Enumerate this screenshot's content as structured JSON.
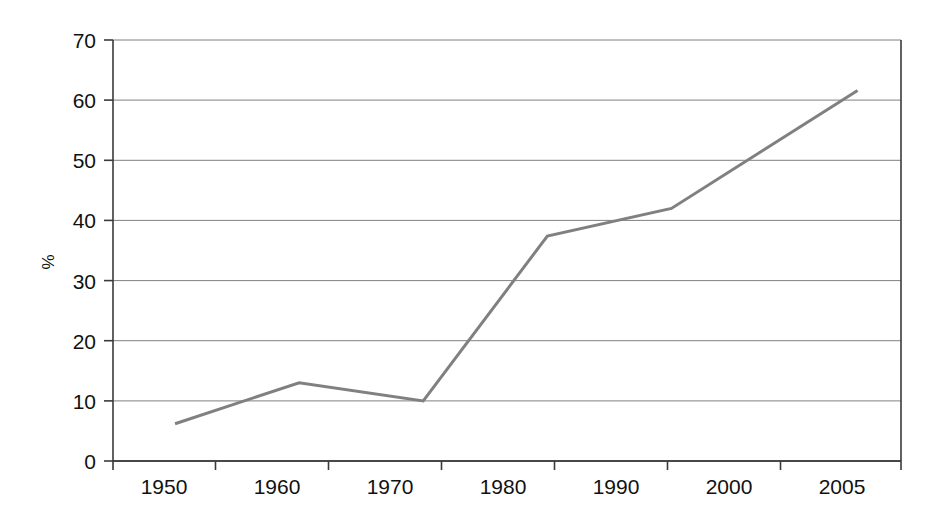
{
  "figure": {
    "background_color": "#ffffff",
    "width": 942,
    "height": 531
  },
  "plot_area": {
    "left": 113,
    "right": 901,
    "top": 40,
    "bottom": 461,
    "border_color": "#3a3a3a",
    "gridline_color": "#808080"
  },
  "axes": {
    "y_label": "%",
    "x_label": "",
    "y_ticks": [
      "0",
      "10",
      "20",
      "30",
      "40",
      "50",
      "60",
      "70"
    ],
    "x_ticks": [
      "1950",
      "1960",
      "1970",
      "1980",
      "1990",
      "2000",
      "2005"
    ]
  },
  "series_style": {
    "line_color": "#808080",
    "line_width": 3
  },
  "chart_data": {
    "type": "line",
    "title": "",
    "xlabel": "",
    "ylabel": "%",
    "categories": [
      "1950",
      "1960",
      "1970",
      "1980",
      "1990",
      "2000",
      "2005"
    ],
    "x": [
      1950,
      1960,
      1970,
      1980,
      1990,
      2000,
      2005
    ],
    "series": [
      {
        "name": "%",
        "values": [
          6.2,
          13.0,
          10.0,
          37.4,
          42.0,
          null,
          61.6
        ],
        "color": "#808080"
      }
    ],
    "points": [
      {
        "x": 1950,
        "y": 6.2
      },
      {
        "x": 1960,
        "y": 13.0
      },
      {
        "x": 1970,
        "y": 10.0
      },
      {
        "x": 1980,
        "y": 37.4
      },
      {
        "x": 1990,
        "y": 42.0
      },
      {
        "x": 2005,
        "y": 61.6
      }
    ],
    "xlim": [
      1945,
      2008.5
    ],
    "ylim": [
      0,
      70
    ],
    "y_tick_values": [
      0,
      10,
      20,
      30,
      40,
      50,
      60,
      70
    ],
    "x_tick_values": [
      1950,
      1960,
      1970,
      1980,
      1990,
      2000,
      2005
    ],
    "grid": true,
    "grid_axis": "y",
    "legend": false,
    "legend_position": "none",
    "markers": false,
    "annotations": []
  }
}
